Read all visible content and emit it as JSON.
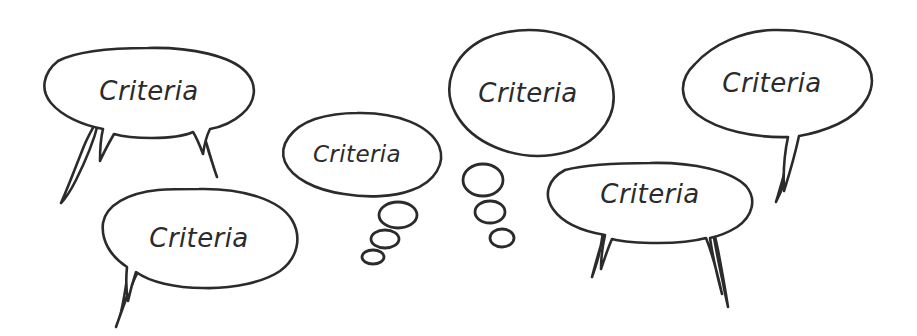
{
  "canvas": {
    "width": 917,
    "height": 336,
    "background_color": "#ffffff",
    "stroke_color": "#2b2b2b",
    "text_color": "#2b2b2b",
    "style": "hand-drawn-sketch"
  },
  "diagram": {
    "title": "",
    "kind": "speech-bubble-cluster",
    "bubble_count": 6,
    "common_label": "Criteria"
  },
  "bubbles": [
    {
      "id": "bubble-top-left",
      "label": "Criteria",
      "kind": "speech",
      "tails": 2,
      "tail_direction": "down",
      "font_size": 26,
      "cx": 149,
      "cy": 90,
      "rx": 104,
      "ry": 42
    },
    {
      "id": "bubble-bottom-left",
      "label": "Criteria",
      "kind": "speech",
      "tails": 1,
      "tail_direction": "down-left",
      "font_size": 26,
      "cx": 199,
      "cy": 238,
      "rx": 99,
      "ry": 49
    },
    {
      "id": "bubble-middle-small",
      "label": "Criteria",
      "kind": "thought",
      "tails": 0,
      "tail_direction": "down-left-dots",
      "dot_count": 3,
      "font_size": 23,
      "cx": 357,
      "cy": 154,
      "rx": 84,
      "ry": 41
    },
    {
      "id": "bubble-top-center",
      "label": "Criteria",
      "kind": "thought",
      "tails": 0,
      "tail_direction": "down-left-dots",
      "dot_count": 3,
      "font_size": 26,
      "cx": 527,
      "cy": 92,
      "rx": 87,
      "ry": 63
    },
    {
      "id": "bubble-bottom-right",
      "label": "Criteria",
      "kind": "speech",
      "tails": 2,
      "tail_direction": "down",
      "font_size": 26,
      "cx": 650,
      "cy": 196,
      "rx": 105,
      "ry": 35
    },
    {
      "id": "bubble-top-right",
      "label": "Criteria",
      "kind": "speech",
      "tails": 1,
      "tail_direction": "down",
      "font_size": 26,
      "cx": 772,
      "cy": 83,
      "rx": 100,
      "ry": 53
    }
  ],
  "thought_dots": {
    "middle_small": [
      {
        "cx": 398,
        "cy": 215,
        "rx": 19,
        "ry": 13
      },
      {
        "cx": 385,
        "cy": 239,
        "rx": 14,
        "ry": 9
      },
      {
        "cx": 373,
        "cy": 257,
        "rx": 11,
        "ry": 7
      }
    ],
    "top_center": [
      {
        "cx": 483,
        "cy": 180,
        "rx": 20,
        "ry": 16
      },
      {
        "cx": 490,
        "cy": 212,
        "rx": 15,
        "ry": 11
      },
      {
        "cx": 502,
        "cy": 238,
        "rx": 12,
        "ry": 9
      }
    ]
  }
}
